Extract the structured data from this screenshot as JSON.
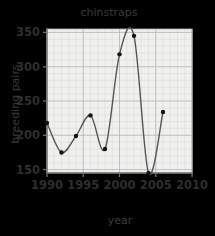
{
  "chart_data": {
    "type": "line",
    "title": "chinstraps",
    "xlabel": "year",
    "ylabel": "breeding pairs",
    "x": [
      1990,
      1992,
      1994,
      1996,
      1998,
      2000,
      2002,
      2004,
      2006
    ],
    "values": [
      218,
      175,
      199,
      229,
      180,
      318,
      345,
      145,
      234
    ],
    "series": [
      {
        "name": "chinstraps",
        "values": [
          218,
          175,
          199,
          229,
          180,
          318,
          345,
          145,
          234
        ]
      }
    ],
    "xlim": [
      1990,
      2010
    ],
    "ylim": [
      145,
      355
    ],
    "xticks": [
      1990,
      1995,
      2000,
      2005,
      2010
    ],
    "xtick_labels": [
      "1990",
      "1995",
      "2000",
      "2005",
      "2010"
    ],
    "yticks": [
      150,
      200,
      250,
      300,
      350
    ],
    "ytick_labels": [
      "150",
      "200",
      "250",
      "300",
      "350"
    ],
    "grid": true,
    "minor_grid": true,
    "legend": false,
    "marker": "circle",
    "line_color": "#555555",
    "marker_color": "#141414",
    "grid_major_color": "#b9b9b9",
    "grid_minor_color": "#d8d8d8",
    "frame_color": "#6e6e6e",
    "background_color": "#f2f2f0",
    "plot_background_color": "#f0f0ee",
    "text_color": "#2e2e2e"
  }
}
